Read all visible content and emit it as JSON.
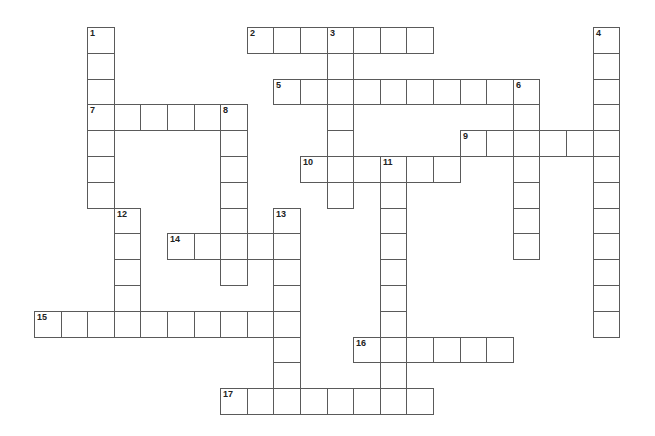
{
  "puzzle": {
    "layout": {
      "origin_x": 34,
      "origin_y": 27,
      "cell_w": 26.6,
      "cell_h": 25.8
    },
    "line_color": "#5a5a5a",
    "background": "#ffffff",
    "words": [
      {
        "number": "1",
        "direction": "down",
        "row": 0,
        "col": 2,
        "length": 7
      },
      {
        "number": "2",
        "direction": "across",
        "row": 0,
        "col": 8,
        "length": 7
      },
      {
        "number": "3",
        "direction": "down",
        "row": 0,
        "col": 11,
        "length": 7
      },
      {
        "number": "4",
        "direction": "down",
        "row": 0,
        "col": 21,
        "length": 12
      },
      {
        "number": "5",
        "direction": "across",
        "row": 2,
        "col": 9,
        "length": 10
      },
      {
        "number": "6",
        "direction": "down",
        "row": 2,
        "col": 18,
        "length": 7
      },
      {
        "number": "7",
        "direction": "across",
        "row": 3,
        "col": 2,
        "length": 6
      },
      {
        "number": "8",
        "direction": "down",
        "row": 3,
        "col": 7,
        "length": 7
      },
      {
        "number": "9",
        "direction": "across",
        "row": 4,
        "col": 16,
        "length": 6
      },
      {
        "number": "10",
        "direction": "across",
        "row": 5,
        "col": 10,
        "length": 6
      },
      {
        "number": "11",
        "direction": "down",
        "row": 5,
        "col": 13,
        "length": 10
      },
      {
        "number": "12",
        "direction": "down",
        "row": 7,
        "col": 3,
        "length": 5
      },
      {
        "number": "13",
        "direction": "down",
        "row": 7,
        "col": 9,
        "length": 8
      },
      {
        "number": "14",
        "direction": "across",
        "row": 8,
        "col": 5,
        "length": 5
      },
      {
        "number": "15",
        "direction": "across",
        "row": 11,
        "col": 0,
        "length": 10
      },
      {
        "number": "16",
        "direction": "across",
        "row": 12,
        "col": 12,
        "length": 6
      },
      {
        "number": "17",
        "direction": "across",
        "row": 14,
        "col": 7,
        "length": 8
      }
    ]
  }
}
